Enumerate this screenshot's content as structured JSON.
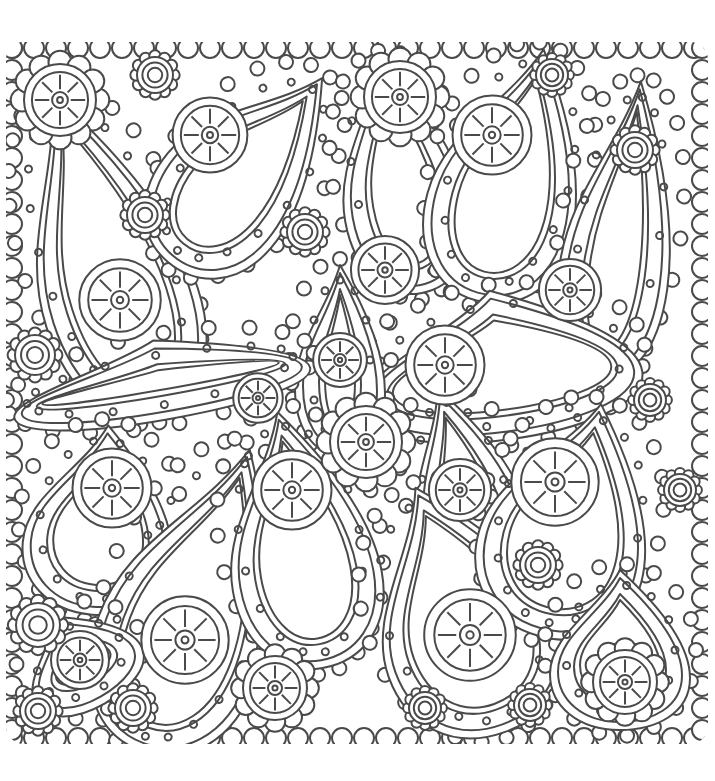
{
  "artwork": {
    "kind": "paisley-coloring-page",
    "line_color": "#4a4a4a",
    "background": "#ffffff",
    "frame": {
      "x": 12,
      "y": 48,
      "width": 690,
      "height": 690
    },
    "paisleys": [
      {
        "cx": 105,
        "cy": 255,
        "rx": 78,
        "ry": 170,
        "rot": -18,
        "eye": [
          120,
          300
        ]
      },
      {
        "cx": 245,
        "cy": 170,
        "rx": 70,
        "ry": 120,
        "rot": 40,
        "eye": [
          210,
          135
        ]
      },
      {
        "cx": 400,
        "cy": 175,
        "rx": 62,
        "ry": 120,
        "rot": -10,
        "eye": [
          385,
          270
        ]
      },
      {
        "cx": 510,
        "cy": 175,
        "rx": 75,
        "ry": 130,
        "rot": 15,
        "eye": [
          492,
          135
        ]
      },
      {
        "cx": 620,
        "cy": 230,
        "rx": 55,
        "ry": 150,
        "rot": 8,
        "eye": [
          570,
          290
        ]
      },
      {
        "cx": 500,
        "cy": 365,
        "rx": 140,
        "ry": 75,
        "rot": -8,
        "eye": [
          445,
          365
        ]
      },
      {
        "cx": 340,
        "cy": 360,
        "rx": 45,
        "ry": 95,
        "rot": 0,
        "eye": [
          340,
          360
        ]
      },
      {
        "cx": 160,
        "cy": 380,
        "rx": 150,
        "ry": 40,
        "rot": -10,
        "eye": [
          258,
          398
        ]
      },
      {
        "cx": 100,
        "cy": 520,
        "rx": 75,
        "ry": 95,
        "rot": 5,
        "eye": [
          112,
          488
        ]
      },
      {
        "cx": 195,
        "cy": 600,
        "rx": 85,
        "ry": 160,
        "rot": 20,
        "eye": [
          185,
          640
        ]
      },
      {
        "cx": 300,
        "cy": 540,
        "rx": 75,
        "ry": 130,
        "rot": -10,
        "eye": [
          292,
          490
        ]
      },
      {
        "cx": 465,
        "cy": 490,
        "rx": 55,
        "ry": 105,
        "rot": -15,
        "eye": [
          460,
          490
        ]
      },
      {
        "cx": 460,
        "cy": 610,
        "rx": 90,
        "ry": 130,
        "rot": -20,
        "eye": [
          470,
          635
        ]
      },
      {
        "cx": 570,
        "cy": 520,
        "rx": 85,
        "ry": 120,
        "rot": 15,
        "eye": [
          555,
          482
        ]
      },
      {
        "cx": 620,
        "cy": 650,
        "rx": 70,
        "ry": 80,
        "rot": 0,
        "eye": [
          625,
          680
        ]
      },
      {
        "cx": 80,
        "cy": 660,
        "rx": 60,
        "ry": 50,
        "rot": -30,
        "eye": [
          80,
          660
        ]
      }
    ],
    "flowers": [
      {
        "x": 60,
        "y": 100,
        "r": 36,
        "wheel": true
      },
      {
        "x": 155,
        "y": 75,
        "r": 18,
        "wheel": false
      },
      {
        "x": 400,
        "y": 97,
        "r": 36,
        "wheel": true
      },
      {
        "x": 552,
        "y": 75,
        "r": 16,
        "wheel": false
      },
      {
        "x": 635,
        "y": 150,
        "r": 18,
        "wheel": false
      },
      {
        "x": 145,
        "y": 215,
        "r": 18,
        "wheel": false
      },
      {
        "x": 305,
        "y": 232,
        "r": 18,
        "wheel": false
      },
      {
        "x": 35,
        "y": 355,
        "r": 20,
        "wheel": false
      },
      {
        "x": 650,
        "y": 400,
        "r": 16,
        "wheel": false
      },
      {
        "x": 366,
        "y": 442,
        "r": 36,
        "wheel": true
      },
      {
        "x": 538,
        "y": 565,
        "r": 18,
        "wheel": false
      },
      {
        "x": 38,
        "y": 625,
        "r": 22,
        "wheel": false
      },
      {
        "x": 275,
        "y": 688,
        "r": 32,
        "wheel": true
      },
      {
        "x": 625,
        "y": 682,
        "r": 32,
        "wheel": true
      },
      {
        "x": 38,
        "y": 711,
        "r": 18,
        "wheel": false
      },
      {
        "x": 133,
        "y": 708,
        "r": 18,
        "wheel": false
      },
      {
        "x": 425,
        "y": 708,
        "r": 16,
        "wheel": false
      },
      {
        "x": 530,
        "y": 705,
        "r": 16,
        "wheel": false
      },
      {
        "x": 680,
        "y": 490,
        "r": 16,
        "wheel": false
      },
      {
        "x": 15,
        "y": 605,
        "r": 0,
        "wheel": false
      }
    ]
  }
}
